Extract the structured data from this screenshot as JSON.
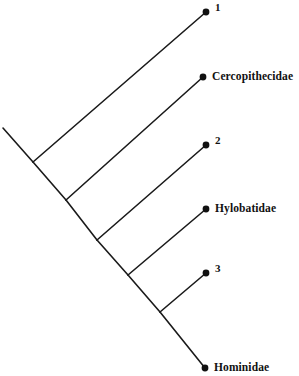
{
  "figure": {
    "type": "cladogram",
    "width": 299,
    "height": 376,
    "background_color": "#ffffff",
    "line_color": "#1a1a1a",
    "node_dot_color": "#111111",
    "line_width": 1.6,
    "node_dot_radius": 3.4,
    "style": "slanted-diagonal"
  },
  "chart_data": {
    "type": "tree",
    "title": "",
    "tips": [
      {
        "id": "tip-1",
        "label": "1",
        "label_kind": "number",
        "x": 206,
        "y": 12,
        "label_x": 215,
        "label_y": 12
      },
      {
        "id": "tip-cercopithecidae",
        "label": "Cercopithecidae",
        "label_kind": "name",
        "x": 203,
        "y": 77,
        "label_x": 212,
        "label_y": 77
      },
      {
        "id": "tip-2",
        "label": "2",
        "label_kind": "number",
        "x": 206,
        "y": 145,
        "label_x": 215,
        "label_y": 145
      },
      {
        "id": "tip-hylobatidae",
        "label": "Hylobatidae",
        "label_kind": "name",
        "x": 206,
        "y": 209,
        "label_x": 215,
        "label_y": 209
      },
      {
        "id": "tip-3",
        "label": "3",
        "label_kind": "number",
        "x": 206,
        "y": 273,
        "label_x": 215,
        "label_y": 273
      },
      {
        "id": "tip-hominidae",
        "label": "Hominidae",
        "label_kind": "name",
        "x": 205,
        "y": 368,
        "label_x": 214,
        "label_y": 368
      }
    ],
    "internal_nodes": [
      {
        "id": "node-a",
        "x": 33,
        "y": 162
      },
      {
        "id": "node-b",
        "x": 66,
        "y": 200
      },
      {
        "id": "node-c",
        "x": 97,
        "y": 240
      },
      {
        "id": "node-d",
        "x": 128,
        "y": 275
      },
      {
        "id": "node-e",
        "x": 160,
        "y": 312
      }
    ],
    "root": {
      "id": "root-stem-start",
      "x": 3,
      "y": 128
    },
    "branches": [
      {
        "id": "branch-root-stem",
        "from": [
          3,
          128
        ],
        "to": [
          33,
          162
        ]
      },
      {
        "id": "branch-a-to-tip1",
        "from": [
          33,
          162
        ],
        "to": [
          206,
          12
        ]
      },
      {
        "id": "branch-a-to-b",
        "from": [
          33,
          162
        ],
        "to": [
          66,
          200
        ]
      },
      {
        "id": "branch-b-to-cercopithecidae",
        "from": [
          66,
          200
        ],
        "to": [
          203,
          77
        ]
      },
      {
        "id": "branch-b-to-c",
        "from": [
          66,
          200
        ],
        "to": [
          97,
          240
        ]
      },
      {
        "id": "branch-c-to-tip2",
        "from": [
          97,
          240
        ],
        "to": [
          206,
          145
        ]
      },
      {
        "id": "branch-c-to-d",
        "from": [
          97,
          240
        ],
        "to": [
          128,
          275
        ]
      },
      {
        "id": "branch-d-to-hylobatidae",
        "from": [
          128,
          275
        ],
        "to": [
          206,
          209
        ]
      },
      {
        "id": "branch-d-to-e",
        "from": [
          128,
          275
        ],
        "to": [
          160,
          312
        ]
      },
      {
        "id": "branch-e-to-tip3",
        "from": [
          160,
          312
        ],
        "to": [
          206,
          273
        ]
      },
      {
        "id": "branch-e-to-hominidae",
        "from": [
          160,
          312
        ],
        "to": [
          205,
          368
        ]
      }
    ],
    "topology_newick": "((((((1),Cercopithecidae),2),Hylobatidae),3),Hominidae)",
    "legend": [],
    "annotations": [],
    "axis": {
      "shown": false
    },
    "grid": false
  }
}
